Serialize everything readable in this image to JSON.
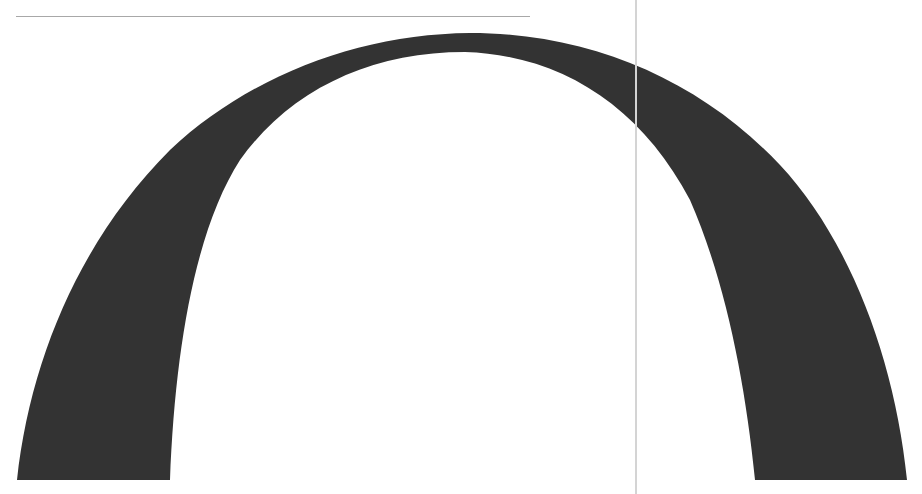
{
  "scene": {
    "description": "Scanned large black arch glyph on white page",
    "background_color": "#ffffff",
    "arch": {
      "fill_color": "#333333",
      "shape_icon": "arch-glyph"
    },
    "top_rule": {
      "color": "#a8a8a8"
    },
    "vertical_rule": {
      "color": "#d4d4d4"
    }
  }
}
